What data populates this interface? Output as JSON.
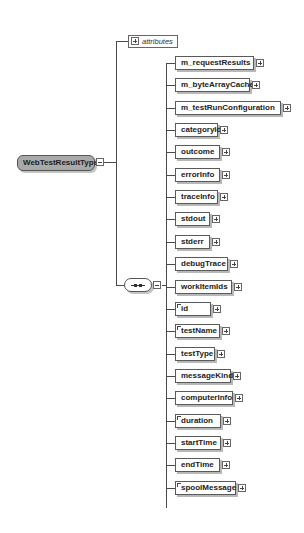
{
  "diagram": {
    "root": {
      "label": "WebTestResultType",
      "collapse_icon": "minus-box-icon"
    },
    "attributes": {
      "label": "attributes",
      "expand_icon": "plus-box-icon"
    },
    "compositor": {
      "type": "sequence",
      "icon": "sequence-dots-icon"
    },
    "elements": [
      {
        "label": "m_requestResults",
        "optional": false
      },
      {
        "label": "m_byteArrayCache",
        "optional": false
      },
      {
        "label": "m_testRunConfiguration",
        "optional": false
      },
      {
        "label": "categoryId",
        "optional": false
      },
      {
        "label": "outcome",
        "optional": false
      },
      {
        "label": "errorInfo",
        "optional": false
      },
      {
        "label": "traceInfo",
        "optional": false
      },
      {
        "label": "stdout",
        "optional": false
      },
      {
        "label": "stderr",
        "optional": false
      },
      {
        "label": "debugTrace",
        "optional": false
      },
      {
        "label": "workItemIds",
        "optional": false
      },
      {
        "label": "id",
        "optional": false,
        "flag": true
      },
      {
        "label": "testName",
        "optional": false,
        "flag": true
      },
      {
        "label": "testType",
        "optional": false
      },
      {
        "label": "messageKind",
        "optional": false
      },
      {
        "label": "computerInfo",
        "optional": false
      },
      {
        "label": "duration",
        "optional": false,
        "flag": true
      },
      {
        "label": "startTime",
        "optional": false
      },
      {
        "label": "endTime",
        "optional": false
      },
      {
        "label": "spoolMessage",
        "optional": false,
        "flag": true
      }
    ]
  }
}
